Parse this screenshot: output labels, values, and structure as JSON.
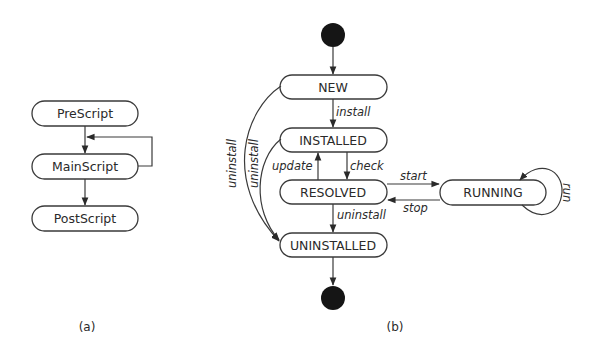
{
  "figure_a": {
    "caption": "(a)",
    "nodes": [
      {
        "id": "prescript",
        "label": "PreScript"
      },
      {
        "id": "mainscript",
        "label": "MainScript"
      },
      {
        "id": "postscript",
        "label": "PostScript"
      }
    ],
    "edges": [
      {
        "from": "prescript",
        "to": "mainscript",
        "label": ""
      },
      {
        "from": "mainscript",
        "to": "mainscript",
        "label": ""
      },
      {
        "from": "mainscript",
        "to": "postscript",
        "label": ""
      }
    ]
  },
  "figure_b": {
    "caption": "(b)",
    "nodes": [
      {
        "id": "initial",
        "label": ""
      },
      {
        "id": "new",
        "label": "NEW"
      },
      {
        "id": "installed",
        "label": "INSTALLED"
      },
      {
        "id": "resolved",
        "label": "RESOLVED"
      },
      {
        "id": "uninstalled",
        "label": "UNINSTALLED"
      },
      {
        "id": "running",
        "label": "RUNNING"
      },
      {
        "id": "final",
        "label": ""
      }
    ],
    "edges": [
      {
        "from": "initial",
        "to": "new",
        "label": ""
      },
      {
        "from": "new",
        "to": "installed",
        "label": "install"
      },
      {
        "from": "installed",
        "to": "resolved",
        "label": "check"
      },
      {
        "from": "resolved",
        "to": "installed",
        "label": "update"
      },
      {
        "from": "resolved",
        "to": "running",
        "label": "start"
      },
      {
        "from": "running",
        "to": "resolved",
        "label": "stop"
      },
      {
        "from": "running",
        "to": "running",
        "label": "run"
      },
      {
        "from": "resolved",
        "to": "uninstalled",
        "label": "uninstall"
      },
      {
        "from": "new",
        "to": "uninstalled",
        "label": "uninstall"
      },
      {
        "from": "installed",
        "to": "uninstalled",
        "label": "uninstall"
      },
      {
        "from": "uninstalled",
        "to": "final",
        "label": ""
      }
    ]
  }
}
